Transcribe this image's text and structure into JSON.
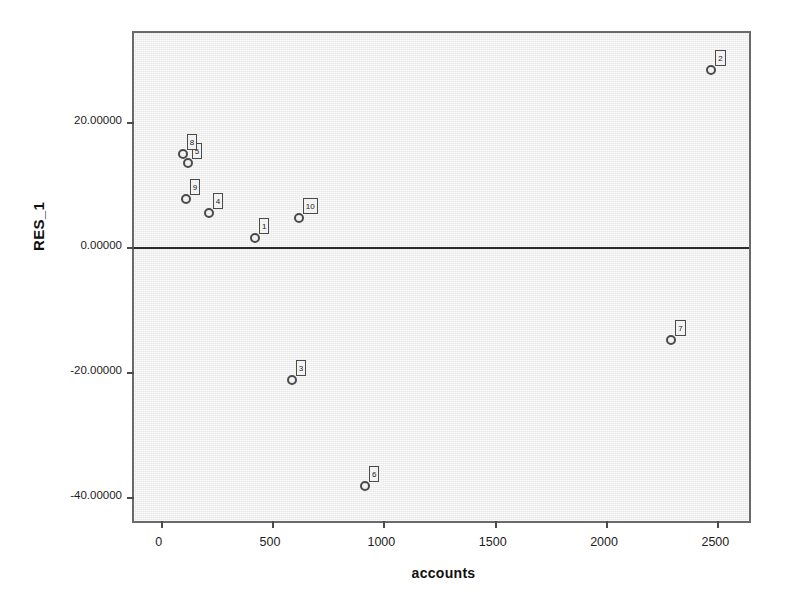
{
  "chart_data": {
    "type": "scatter",
    "title": "",
    "xlabel": "accounts",
    "ylabel": "RES_1",
    "xlim": [
      -120,
      2660
    ],
    "ylim": [
      -44.5,
      34.2
    ],
    "grid": false,
    "legend": null,
    "zero_reference_line": 0,
    "x_ticks": [
      0,
      500,
      1000,
      1500,
      2000,
      2500
    ],
    "x_tick_labels": [
      "0",
      "500",
      "1000",
      "1500",
      "2000",
      "2500"
    ],
    "y_ticks": [
      20,
      0,
      -20,
      -40
    ],
    "y_tick_labels": [
      "20.00000",
      "0.00000",
      "-20.00000",
      "-40.00000"
    ],
    "point_label_field": "case number",
    "points": [
      {
        "label": "1",
        "x": 423,
        "y": 1.4
      },
      {
        "label": "2",
        "x": 2473,
        "y": 28.3
      },
      {
        "label": "3",
        "x": 589,
        "y": -21.3
      },
      {
        "label": "4",
        "x": 216,
        "y": 5.4
      },
      {
        "label": "5",
        "x": 121,
        "y": 13.4
      },
      {
        "label": "6",
        "x": 917,
        "y": -38.2
      },
      {
        "label": "7",
        "x": 2293,
        "y": -14.9
      },
      {
        "label": "8",
        "x": 99,
        "y": 14.9
      },
      {
        "label": "9",
        "x": 112,
        "y": 7.7
      },
      {
        "label": "10",
        "x": 620,
        "y": 4.6
      }
    ]
  },
  "colors": {
    "plot_background": "#e8e8e8",
    "page_background": "#ffffff",
    "frame": "#6a6a6a",
    "marker_stroke": "#4a4a4a",
    "label_background": "#f2f2f2",
    "reference_line": "#2b2b2b",
    "text": "#1a1a1a"
  }
}
